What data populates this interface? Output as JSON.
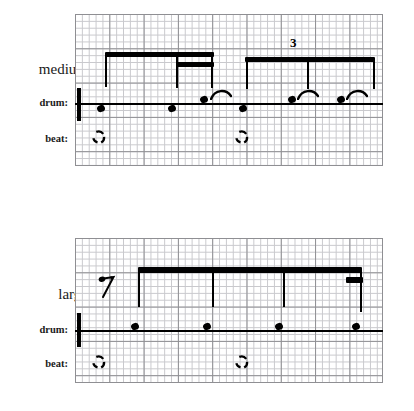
{
  "figure": {
    "type": "music-notation-grid"
  },
  "staves": [
    {
      "id": "medium",
      "name_label": "medium",
      "drum_label": "drum:",
      "beat_label": "beat:",
      "grid": {
        "x": 75,
        "y": 14,
        "width": 308,
        "height": 152,
        "cell": 6.86,
        "major_every": 5
      },
      "drumline": {
        "x": 75,
        "y": 103,
        "width": 308
      },
      "barlines": [
        {
          "x": 77,
          "y": 88,
          "height": 33,
          "width": 4
        }
      ],
      "beams": [
        {
          "x": 105,
          "y": 52,
          "width": 109,
          "height": 5,
          "level": 1
        },
        {
          "x": 176,
          "y": 62,
          "width": 38,
          "height": 5,
          "level": 2
        },
        {
          "x": 245,
          "y": 58,
          "width": 130,
          "height": 5,
          "level": 1
        }
      ],
      "stems": [
        {
          "x": 105,
          "y": 52,
          "height": 34
        },
        {
          "x": 176,
          "y": 62,
          "height": 26
        },
        {
          "x": 212,
          "y": 62,
          "height": 26
        },
        {
          "x": 246,
          "y": 58,
          "height": 30
        },
        {
          "x": 308,
          "y": 58,
          "height": 30
        },
        {
          "x": 373,
          "y": 58,
          "height": 30
        }
      ],
      "tuplet": {
        "label": "3",
        "x": 292,
        "y": 36
      },
      "noteheads": [
        {
          "x": 100,
          "y": 106
        },
        {
          "x": 171,
          "y": 106
        },
        {
          "x": 241,
          "y": 106
        },
        {
          "x": 203,
          "y": 96
        },
        {
          "x": 290,
          "y": 96
        },
        {
          "x": 338,
          "y": 96
        }
      ],
      "arcs": [
        {
          "x": 213,
          "y": 90
        },
        {
          "x": 300,
          "y": 90
        },
        {
          "x": 348,
          "y": 90
        }
      ],
      "beatmarks": [
        {
          "x": 95,
          "y": 133
        },
        {
          "x": 238,
          "y": 133
        }
      ]
    },
    {
      "id": "large",
      "name_label": "large",
      "drum_label": "drum:",
      "beat_label": "beat:",
      "grid": {
        "x": 75,
        "y": 238,
        "width": 308,
        "height": 145,
        "cell": 6.86,
        "major_every": 5
      },
      "drumline": {
        "x": 75,
        "y": 330,
        "width": 308
      },
      "barlines": [
        {
          "x": 77,
          "y": 313,
          "height": 34,
          "width": 4
        }
      ],
      "beams": [
        {
          "x": 138,
          "y": 268,
          "width": 224,
          "height": 5,
          "level": 1
        },
        {
          "x": 346,
          "y": 277,
          "height": 6,
          "width": 17,
          "level": 2
        }
      ],
      "stems": [
        {
          "x": 139,
          "y": 268,
          "height": 38
        },
        {
          "x": 213,
          "y": 268,
          "height": 38
        },
        {
          "x": 283,
          "y": 268,
          "height": 38
        },
        {
          "x": 360,
          "y": 268,
          "height": 42
        }
      ],
      "rest": {
        "glyph": "eighth-rest",
        "x": 99,
        "y": 276
      },
      "noteheads": [
        {
          "x": 133,
          "y": 326
        },
        {
          "x": 204,
          "y": 326
        },
        {
          "x": 276,
          "y": 326
        },
        {
          "x": 353,
          "y": 326
        }
      ],
      "arcs": [],
      "beatmarks": [
        {
          "x": 95,
          "y": 358
        },
        {
          "x": 238,
          "y": 358
        }
      ]
    }
  ],
  "labels": {
    "medium": {
      "text": "medium",
      "x": 8,
      "y": 62
    },
    "medium_drum": {
      "text": "drum:",
      "x": 30,
      "y": 99
    },
    "medium_beat": {
      "text": "beat:",
      "x": 36,
      "y": 135
    },
    "large": {
      "text": "large",
      "x": 21,
      "y": 287
    },
    "large_drum": {
      "text": "drum:",
      "x": 30,
      "y": 326
    },
    "large_beat": {
      "text": "beat:",
      "x": 36,
      "y": 360
    }
  },
  "colors": {
    "ink": "#000000",
    "grid_minor": "#c9c9cd",
    "grid_major": "#8f8f93",
    "paper": "#ffffff"
  }
}
